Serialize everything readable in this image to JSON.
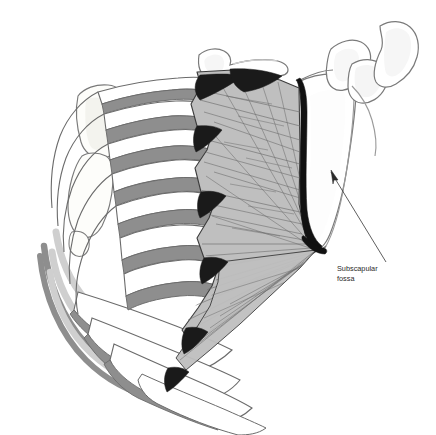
{
  "figure": {
    "title": "Serratus anterior.",
    "background_color": "#ffffff",
    "width": 436,
    "height": 435
  },
  "labels": [
    {
      "id": "subscapular-fossa",
      "line1": "Subscapular",
      "line2": "fossa",
      "text_x": 337,
      "text_y": 271,
      "leader_from": [
        336,
        277
      ],
      "leader_to": [
        331,
        170
      ],
      "arrow_tip": [
        331,
        170
      ]
    }
  ],
  "structures": {
    "muscle": {
      "name": "serratus anterior",
      "fill_color": "#bfbfbf",
      "fiber_color": "#6e6e6e",
      "outline_color": "#3c3c3c"
    },
    "ribs": {
      "name": "ribs",
      "fill_color": "#ffffff",
      "shadow_color": "#8c8c8c",
      "outline_color": "#5a5a5a"
    },
    "intercostal": {
      "name": "intercostal space",
      "fill_color": "#8c8c8c"
    },
    "digitation_attachment": {
      "name": "muscle digitation attachment",
      "fill_color": "#1a1a1a"
    },
    "scapula": {
      "name": "scapula",
      "fill_color": "#ffffff",
      "outline_color": "#7a7a7a",
      "medial_border_color": "#111111"
    },
    "costal_cartilage": {
      "name": "costal cartilage",
      "fill_color": "#d9d9d9",
      "outline_color": "#6e6e6e"
    },
    "sternum": {
      "name": "sternum",
      "fill_color": "#fbfbf7",
      "outline_color": "#7a7a7a"
    },
    "clavicle": {
      "name": "clavicle",
      "fill_color": "#ffffff",
      "outline_color": "#7a7a7a"
    }
  },
  "view": {
    "orientation": "anterolateral view of right thoracic cage and scapula",
    "rib_count": 10
  }
}
